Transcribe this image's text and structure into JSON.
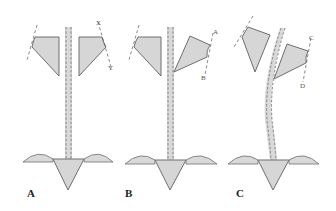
{
  "figure": {
    "panels": [
      {
        "id": "A",
        "label": "A",
        "markers": [
          "X",
          "Y"
        ],
        "stem": "straight"
      },
      {
        "id": "B",
        "label": "B",
        "markers": [
          "A",
          "B"
        ],
        "stem": "straight"
      },
      {
        "id": "C",
        "label": "C",
        "markers": [
          "C",
          "D"
        ],
        "stem": "curved"
      }
    ],
    "colors": {
      "fill": "#d6d6d6",
      "stroke": "#6e6e6e",
      "background": "#ffffff"
    }
  }
}
